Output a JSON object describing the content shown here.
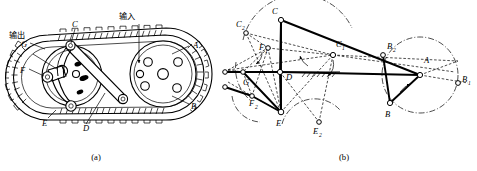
{
  "figure": {
    "background_color": "#ffffff",
    "ink_color": "#000000",
    "panels": [
      {
        "id": "a",
        "caption": "(a)",
        "description": "Mechanical assembly view: endless chain loop over two sprockets with internal linkage",
        "annotations": [
          {
            "name": "input-label",
            "text": "输入",
            "meaning": "input"
          },
          {
            "name": "output-label",
            "text": "输出",
            "meaning": "output"
          }
        ],
        "point_labels": [
          {
            "name": "label-A",
            "text": "A"
          },
          {
            "name": "label-B",
            "text": "B"
          },
          {
            "name": "label-C",
            "text": "C"
          },
          {
            "name": "label-D",
            "text": "D"
          },
          {
            "name": "label-E",
            "text": "E"
          },
          {
            "name": "label-F",
            "text": "F"
          },
          {
            "name": "label-G",
            "text": "G"
          }
        ]
      },
      {
        "id": "b",
        "caption": "(b)",
        "description": "Kinematic skeleton diagram with position loci, dash-dot trajectory circles and dashed alternate positions",
        "point_labels": [
          {
            "name": "label-A",
            "text": "A",
            "sub": ""
          },
          {
            "name": "label-B",
            "text": "B",
            "sub": ""
          },
          {
            "name": "label-B1",
            "text": "B",
            "sub": "1"
          },
          {
            "name": "label-B2",
            "text": "B",
            "sub": "2"
          },
          {
            "name": "label-C",
            "text": "C",
            "sub": ""
          },
          {
            "name": "label-C1",
            "text": "C",
            "sub": "1"
          },
          {
            "name": "label-C2",
            "text": "C",
            "sub": "2"
          },
          {
            "name": "label-D",
            "text": "D",
            "sub": ""
          },
          {
            "name": "label-E",
            "text": "E",
            "sub": ""
          },
          {
            "name": "label-E2",
            "text": "E",
            "sub": "2"
          },
          {
            "name": "label-F",
            "text": "F",
            "sub": "1"
          },
          {
            "name": "label-F2",
            "text": "F",
            "sub": "2"
          },
          {
            "name": "label-G",
            "text": "G",
            "sub": ""
          }
        ]
      }
    ]
  }
}
